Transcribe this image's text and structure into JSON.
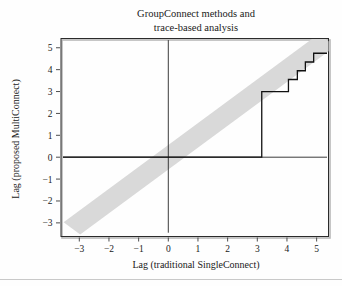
{
  "chart_data": {
    "type": "line",
    "title": "GroupConnect methods and trace-based analysis",
    "title_line1": "GroupConnect methods and",
    "title_line2": "trace-based analysis",
    "xlabel": "Lag (traditional SingleConnect)",
    "ylabel": "Lag (proposed MultiConnect)",
    "xlim": [
      -3.6,
      5.4
    ],
    "ylim": [
      -3.6,
      5.4
    ],
    "xticks": [
      -3,
      -2,
      -1,
      0,
      1,
      2,
      3,
      4,
      5
    ],
    "yticks": [
      -3,
      -2,
      -1,
      0,
      1,
      2,
      3,
      4,
      5
    ],
    "xtick_labels": [
      "−3",
      "−2",
      "−1",
      "0",
      "1",
      "2",
      "3",
      "4",
      "5"
    ],
    "ytick_labels": [
      "−3",
      "−2",
      "−1",
      "0",
      "1",
      "2",
      "3",
      "4",
      "5"
    ],
    "grid": false,
    "legend": "none",
    "series": [
      {
        "name": "reference-band",
        "type": "area",
        "style": "thick-gray-diagonal",
        "color": "#d9d9d9",
        "description": "identity line y = x drawn as a thick shaded band",
        "x": [
          -3.25,
          5.35
        ],
        "y": [
          -3.25,
          5.35
        ],
        "band_halfwidth": 0.28
      },
      {
        "name": "step-function",
        "type": "step",
        "color": "#111111",
        "description": "black step curve flat at zero then rising in discrete jumps",
        "x": [
          -3.55,
          3.15,
          3.15,
          4.05,
          4.05,
          4.35,
          4.35,
          4.62,
          4.62,
          4.9,
          4.9,
          5.35
        ],
        "y": [
          0,
          0,
          3.0,
          3.0,
          3.55,
          3.55,
          3.95,
          3.95,
          4.35,
          4.35,
          4.75,
          4.75
        ]
      }
    ],
    "annotations": [
      {
        "name": "vertical-zero-axis",
        "type": "vline",
        "x": 0,
        "color": "#262626"
      },
      {
        "name": "horizontal-zero-axis",
        "type": "hline",
        "y": 0,
        "color": "#262626"
      }
    ]
  },
  "colors": {
    "band": "#d9d9d9",
    "curve": "#111111",
    "frame": "#2b2b2b",
    "text": "#1a1a1a",
    "background": "#fefefe"
  }
}
